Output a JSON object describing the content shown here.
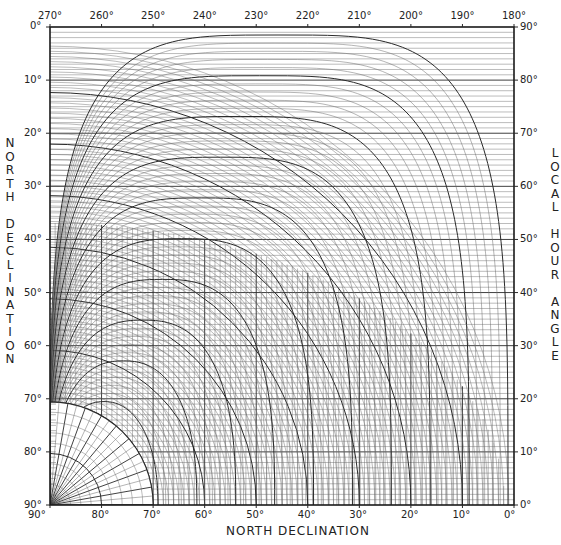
{
  "chart_data": {
    "type": "nomogram",
    "title": "",
    "frame": {
      "left": 50,
      "top": 27,
      "right": 514,
      "bottom": 505
    },
    "top_axis": {
      "label": "",
      "ticks": [
        "270°",
        "260°",
        "250°",
        "240°",
        "230°",
        "220°",
        "210°",
        "200°",
        "190°",
        "180°"
      ],
      "values": [
        270,
        260,
        250,
        240,
        230,
        220,
        210,
        200,
        190,
        180
      ]
    },
    "left_axis": {
      "label": "NORTH DECLINATION",
      "ticks": [
        "0°",
        "10°",
        "20°",
        "30°",
        "40°",
        "50°",
        "60°",
        "70°",
        "80°",
        "90°"
      ],
      "values": [
        0,
        10,
        20,
        30,
        40,
        50,
        60,
        70,
        80,
        90
      ]
    },
    "right_axis": {
      "label": "LOCAL HOUR ANGLE",
      "ticks": [
        "90°",
        "80°",
        "70°",
        "60°",
        "50°",
        "40°",
        "30°",
        "20°",
        "10°",
        "0°"
      ],
      "values": [
        90,
        80,
        70,
        60,
        50,
        40,
        30,
        20,
        10,
        0
      ]
    },
    "bottom_axis": {
      "label": "NORTH DECLINATION",
      "ticks": [
        "90°",
        "80°",
        "70°",
        "60°",
        "50°",
        "40°",
        "30°",
        "20°",
        "10°",
        "0°"
      ],
      "values": [
        90,
        80,
        70,
        60,
        50,
        40,
        30,
        20,
        10,
        0
      ]
    },
    "grid": {
      "minor_step_deg": 1,
      "major_step_deg": 10,
      "inner_polar_radius_deg": 20,
      "inner_radial_step_deg": 5,
      "hour_angle_curves": 46
    },
    "colors": {
      "line": "#2a2a2a",
      "minor_line": "#6a6a6a",
      "background": "#ffffff"
    }
  },
  "labels": {
    "bottom_title": "NORTH DECLINATION",
    "left_title": [
      "N",
      "O",
      "R",
      "T",
      "H",
      "",
      "D",
      "E",
      "C",
      "L",
      "I",
      "N",
      "A",
      "T",
      "I",
      "O",
      "N"
    ],
    "right_title": [
      "L",
      "O",
      "C",
      "A",
      "L",
      "",
      "H",
      "O",
      "U",
      "R",
      "",
      "A",
      "N",
      "G",
      "L",
      "E"
    ]
  }
}
